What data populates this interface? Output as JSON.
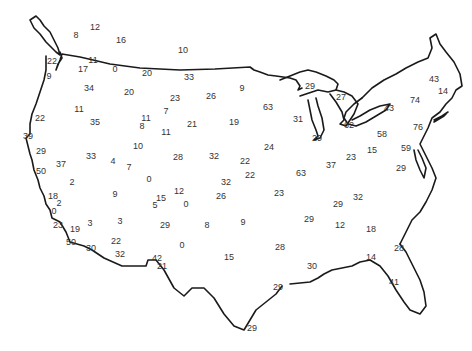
{
  "map": {
    "region": "Contiguous United States",
    "outline_color": "#1a1a1a",
    "label_color": "#333333",
    "background": "#ffffff"
  },
  "values": [
    {
      "v": "12",
      "x": 95,
      "y": 27
    },
    {
      "v": "8",
      "x": 76,
      "y": 35
    },
    {
      "v": "16",
      "x": 121,
      "y": 40
    },
    {
      "v": "10",
      "x": 183,
      "y": 50
    },
    {
      "v": "22",
      "x": 52,
      "y": 61
    },
    {
      "v": "11",
      "x": 93,
      "y": 60
    },
    {
      "v": "17",
      "x": 83,
      "y": 69
    },
    {
      "v": "0",
      "x": 115,
      "y": 69
    },
    {
      "v": "20",
      "x": 147,
      "y": 73
    },
    {
      "v": "33",
      "x": 189,
      "y": 77
    },
    {
      "v": "9",
      "x": 49,
      "y": 76
    },
    {
      "v": "34",
      "x": 89,
      "y": 88
    },
    {
      "v": "20",
      "x": 129,
      "y": 92
    },
    {
      "v": "23",
      "x": 175,
      "y": 98
    },
    {
      "v": "26",
      "x": 211,
      "y": 96
    },
    {
      "v": "9",
      "x": 242,
      "y": 88
    },
    {
      "v": "29",
      "x": 310,
      "y": 86
    },
    {
      "v": "27",
      "x": 341,
      "y": 97
    },
    {
      "v": "43",
      "x": 434,
      "y": 79
    },
    {
      "v": "14",
      "x": 443,
      "y": 91
    },
    {
      "v": "74",
      "x": 415,
      "y": 100
    },
    {
      "v": "43",
      "x": 389,
      "y": 108
    },
    {
      "v": "11",
      "x": 79,
      "y": 109
    },
    {
      "v": "7",
      "x": 166,
      "y": 111
    },
    {
      "v": "63",
      "x": 268,
      "y": 107
    },
    {
      "v": "31",
      "x": 298,
      "y": 119
    },
    {
      "v": "22",
      "x": 40,
      "y": 118
    },
    {
      "v": "35",
      "x": 95,
      "y": 122
    },
    {
      "v": "11",
      "x": 146,
      "y": 118
    },
    {
      "v": "8",
      "x": 142,
      "y": 126
    },
    {
      "v": "21",
      "x": 192,
      "y": 124
    },
    {
      "v": "19",
      "x": 234,
      "y": 122
    },
    {
      "v": "11",
      "x": 166,
      "y": 132
    },
    {
      "v": "62",
      "x": 349,
      "y": 125
    },
    {
      "v": "58",
      "x": 382,
      "y": 134
    },
    {
      "v": "76",
      "x": 418,
      "y": 127
    },
    {
      "v": "29",
      "x": 317,
      "y": 138
    },
    {
      "v": "39",
      "x": 28,
      "y": 136
    },
    {
      "v": "24",
      "x": 269,
      "y": 147
    },
    {
      "v": "10",
      "x": 138,
      "y": 146
    },
    {
      "v": "29",
      "x": 41,
      "y": 151
    },
    {
      "v": "33",
      "x": 91,
      "y": 156
    },
    {
      "v": "4",
      "x": 113,
      "y": 161
    },
    {
      "v": "7",
      "x": 129,
      "y": 167
    },
    {
      "v": "28",
      "x": 178,
      "y": 157
    },
    {
      "v": "32",
      "x": 214,
      "y": 156
    },
    {
      "v": "22",
      "x": 245,
      "y": 161
    },
    {
      "v": "15",
      "x": 372,
      "y": 150
    },
    {
      "v": "59",
      "x": 406,
      "y": 148
    },
    {
      "v": "23",
      "x": 351,
      "y": 157
    },
    {
      "v": "37",
      "x": 61,
      "y": 164
    },
    {
      "v": "50",
      "x": 41,
      "y": 171
    },
    {
      "v": "0",
      "x": 149,
      "y": 179
    },
    {
      "v": "22",
      "x": 250,
      "y": 175
    },
    {
      "v": "63",
      "x": 301,
      "y": 173
    },
    {
      "v": "37",
      "x": 331,
      "y": 165
    },
    {
      "v": "29",
      "x": 401,
      "y": 168
    },
    {
      "v": "2",
      "x": 72,
      "y": 182
    },
    {
      "v": "32",
      "x": 226,
      "y": 182
    },
    {
      "v": "12",
      "x": 179,
      "y": 191
    },
    {
      "v": "9",
      "x": 115,
      "y": 194
    },
    {
      "v": "26",
      "x": 221,
      "y": 196
    },
    {
      "v": "23",
      "x": 279,
      "y": 193
    },
    {
      "v": "18",
      "x": 53,
      "y": 196
    },
    {
      "v": "2",
      "x": 59,
      "y": 203
    },
    {
      "v": "15",
      "x": 161,
      "y": 198
    },
    {
      "v": "5",
      "x": 155,
      "y": 205
    },
    {
      "v": "0",
      "x": 186,
      "y": 204
    },
    {
      "v": "29",
      "x": 338,
      "y": 204
    },
    {
      "v": "32",
      "x": 358,
      "y": 197
    },
    {
      "v": "0",
      "x": 54,
      "y": 211
    },
    {
      "v": "23",
      "x": 58,
      "y": 225
    },
    {
      "v": "19",
      "x": 75,
      "y": 229
    },
    {
      "v": "3",
      "x": 90,
      "y": 223
    },
    {
      "v": "3",
      "x": 120,
      "y": 221
    },
    {
      "v": "29",
      "x": 165,
      "y": 225
    },
    {
      "v": "8",
      "x": 207,
      "y": 225
    },
    {
      "v": "9",
      "x": 243,
      "y": 222
    },
    {
      "v": "29",
      "x": 309,
      "y": 219
    },
    {
      "v": "12",
      "x": 340,
      "y": 225
    },
    {
      "v": "18",
      "x": 371,
      "y": 229
    },
    {
      "v": "50",
      "x": 71,
      "y": 242
    },
    {
      "v": "30",
      "x": 91,
      "y": 248
    },
    {
      "v": "22",
      "x": 116,
      "y": 241
    },
    {
      "v": "32",
      "x": 120,
      "y": 254
    },
    {
      "v": "0",
      "x": 182,
      "y": 245
    },
    {
      "v": "28",
      "x": 280,
      "y": 247
    },
    {
      "v": "28",
      "x": 399,
      "y": 248
    },
    {
      "v": "42",
      "x": 157,
      "y": 258
    },
    {
      "v": "21",
      "x": 162,
      "y": 266
    },
    {
      "v": "15",
      "x": 229,
      "y": 257
    },
    {
      "v": "14",
      "x": 371,
      "y": 257
    },
    {
      "v": "30",
      "x": 312,
      "y": 266
    },
    {
      "v": "41",
      "x": 394,
      "y": 282
    },
    {
      "v": "29",
      "x": 278,
      "y": 287
    },
    {
      "v": "29",
      "x": 252,
      "y": 328
    }
  ]
}
